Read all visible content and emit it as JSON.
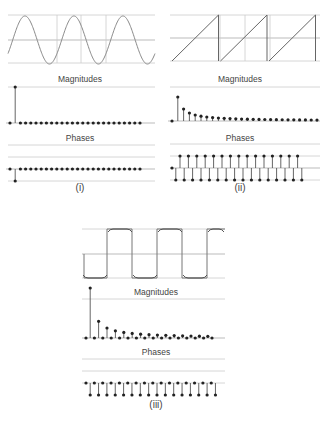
{
  "panels": [
    {
      "id": "i",
      "caption": "(i)",
      "signal": "sine",
      "magnitudes_label": "Magnitudes",
      "phases_label": "Phases"
    },
    {
      "id": "ii",
      "caption": "(ii)",
      "signal": "sawtooth",
      "magnitudes_label": "Magnitudes",
      "phases_label": "Phases"
    },
    {
      "id": "iii",
      "caption": "(iii)",
      "signal": "square",
      "magnitudes_label": "Magnitudes",
      "phases_label": "Phases"
    }
  ],
  "colors": {
    "waveform": "#888888",
    "grid": "#cccccc",
    "stem": "#555555",
    "dot": "#222222"
  },
  "chart_data": [
    {
      "type": "line",
      "title": "(i) sine wave — time domain",
      "cycles": 3,
      "grid": true
    },
    {
      "type": "bar",
      "title": "(i) Magnitudes",
      "harmonics": 26,
      "values": [
        0,
        1,
        0,
        0,
        0,
        0,
        0,
        0,
        0,
        0,
        0,
        0,
        0,
        0,
        0,
        0,
        0,
        0,
        0,
        0,
        0,
        0,
        0,
        0,
        0,
        0
      ]
    },
    {
      "type": "bar",
      "title": "(i) Phases",
      "values": [
        0,
        -1,
        0,
        0,
        0,
        0,
        0,
        0,
        0,
        0,
        0,
        0,
        0,
        0,
        0,
        0,
        0,
        0,
        0,
        0,
        0,
        0,
        0,
        0,
        0,
        0
      ]
    },
    {
      "type": "line",
      "title": "(ii) sawtooth wave — time domain",
      "cycles": 3,
      "grid": true
    },
    {
      "type": "bar",
      "title": "(ii) Magnitudes",
      "values": [
        0,
        1,
        0.5,
        0.333,
        0.25,
        0.2,
        0.167,
        0.143,
        0.125,
        0.111,
        0.1,
        0.091,
        0.083,
        0.077,
        0.071,
        0.067,
        0.063,
        0.059,
        0.056,
        0.053,
        0.05,
        0.048,
        0.045,
        0.043,
        0.042,
        0.04
      ]
    },
    {
      "type": "bar",
      "title": "(ii) Phases",
      "values": [
        0,
        -1,
        1,
        -1,
        1,
        -1,
        1,
        -1,
        1,
        -1,
        1,
        -1,
        1,
        -1,
        1,
        -1,
        1,
        -1,
        1,
        -1,
        1,
        -1,
        1,
        -1,
        1,
        -1,
        1,
        -1,
        1,
        -1,
        1
      ]
    },
    {
      "type": "line",
      "title": "(iii) square wave — time domain",
      "cycles": 3,
      "grid": true
    },
    {
      "type": "bar",
      "title": "(iii) Magnitudes",
      "values": [
        0,
        1,
        0,
        0.333,
        0,
        0.2,
        0,
        0.143,
        0,
        0.111,
        0,
        0.091,
        0,
        0.077,
        0,
        0.067,
        0,
        0.059,
        0,
        0.053,
        0,
        0.048,
        0,
        0.043,
        0,
        0.04,
        0,
        0.037,
        0,
        0.034,
        0
      ]
    },
    {
      "type": "bar",
      "title": "(iii) Phases",
      "values": [
        1,
        -1,
        1,
        -1,
        1,
        -1,
        1,
        -1,
        1,
        -1,
        1,
        -1,
        1,
        -1,
        1,
        -1,
        1,
        -1,
        1,
        -1,
        1,
        -1,
        1,
        -1,
        1,
        -1,
        1,
        -1,
        1,
        -1,
        1
      ]
    }
  ]
}
